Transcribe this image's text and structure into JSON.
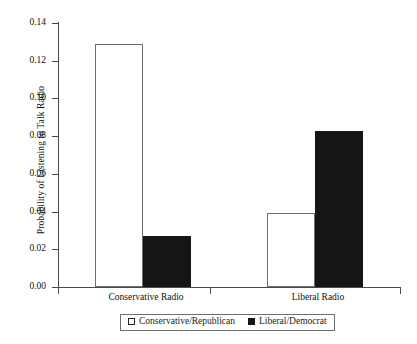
{
  "chart_data": {
    "type": "bar",
    "title": "",
    "xlabel": "",
    "ylabel": "Probability of Listening to Talk Radio",
    "categories": [
      "Conservative Radio",
      "Liberal Radio"
    ],
    "series": [
      {
        "name": "Conservative/Republican",
        "values": [
          0.129,
          0.039
        ],
        "style": "hollow",
        "color": "#ffffff"
      },
      {
        "name": "Liberal/Democrat",
        "values": [
          0.027,
          0.083
        ],
        "style": "filled",
        "color": "#151515"
      }
    ],
    "ylim": [
      0.0,
      0.14
    ],
    "yticks": [
      0.0,
      0.02,
      0.04,
      0.06,
      0.08,
      0.1,
      0.12,
      0.14
    ],
    "ytick_labels": [
      "0.00",
      "0.02",
      "0.04",
      "0.06",
      "0.08",
      "0.10",
      "0.12",
      "0.14"
    ],
    "grid": false,
    "legend_position": "bottom-center",
    "frame": "left-bottom-spines"
  },
  "legend": {
    "entries": [
      {
        "label": "Conservative/Republican",
        "swatch": "hollow-square"
      },
      {
        "label": "Liberal/Democrat",
        "swatch": "filled-square"
      }
    ]
  }
}
